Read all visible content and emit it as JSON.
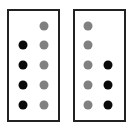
{
  "colors": {
    "black_dot": "#0a0a0a",
    "gray_dot": "#808080",
    "border": "#222222"
  },
  "panels": [
    {
      "name": "left-panel",
      "box": {
        "x": 7,
        "y": 9,
        "w": 53,
        "h": 113
      },
      "dots": [
        {
          "color": "gray",
          "x": 44,
          "y": 26
        },
        {
          "color": "black",
          "x": 23,
          "y": 45
        },
        {
          "color": "gray",
          "x": 44,
          "y": 45
        },
        {
          "color": "black",
          "x": 23,
          "y": 65
        },
        {
          "color": "gray",
          "x": 44,
          "y": 65
        },
        {
          "color": "black",
          "x": 23,
          "y": 85
        },
        {
          "color": "gray",
          "x": 44,
          "y": 85
        },
        {
          "color": "black",
          "x": 23,
          "y": 105
        },
        {
          "color": "gray",
          "x": 44,
          "y": 105
        }
      ]
    },
    {
      "name": "right-panel",
      "box": {
        "x": 73,
        "y": 9,
        "w": 53,
        "h": 113
      },
      "dots": [
        {
          "color": "gray",
          "x": 88,
          "y": 26
        },
        {
          "color": "gray",
          "x": 88,
          "y": 45
        },
        {
          "color": "gray",
          "x": 88,
          "y": 65
        },
        {
          "color": "black",
          "x": 108,
          "y": 65
        },
        {
          "color": "gray",
          "x": 88,
          "y": 85
        },
        {
          "color": "black",
          "x": 108,
          "y": 85
        },
        {
          "color": "gray",
          "x": 88,
          "y": 105
        },
        {
          "color": "black",
          "x": 108,
          "y": 105
        }
      ]
    }
  ],
  "summary": {
    "left_panel": {
      "gray_count": 5,
      "black_count": 4
    },
    "right_panel": {
      "gray_count": 5,
      "black_count": 3
    }
  }
}
